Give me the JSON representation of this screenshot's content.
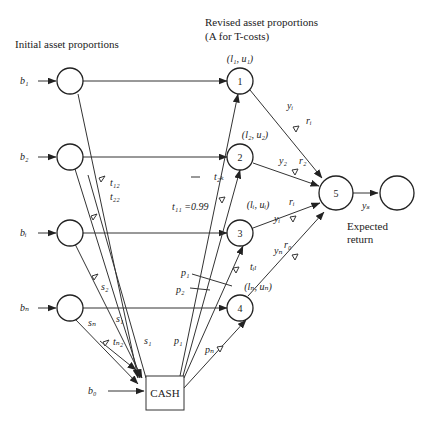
{
  "diagram": {
    "headings": {
      "initial": "Initial asset proportions",
      "revised_line1": "Revised asset proportions",
      "revised_line2": "(A for T-costs)",
      "expected_line1": "Expected",
      "expected_line2": "return"
    },
    "inputs": {
      "b1": "b₁",
      "b2": "b₂",
      "bi": "bᵢ",
      "bn": "bₙ",
      "b0": "b₀"
    },
    "cash_label": "CASH",
    "nodes": {
      "n1": "1",
      "n2": "2",
      "n3": "3",
      "n4": "4",
      "n5": "5"
    },
    "bounds": {
      "n1": "(l₁, u₁)",
      "n2": "(l₂, u₂)",
      "n3": "(lᵢ, uᵢ)",
      "n4": "(lₙ, uₙ)"
    },
    "edge_labels": {
      "t12": "t₁₂",
      "t22": "t₂₂",
      "t2k": "t₂ₖ",
      "t11": "t₁₁ =0.99",
      "til": "tᵢₗ",
      "tn2": "tₙ₂",
      "s1a": "s₁",
      "s1b": "s₁",
      "s2": "s₂",
      "sn": "sₙ",
      "p1a": "p₁",
      "p2": "p₂",
      "p1b": "p₁",
      "pn": "pₙ",
      "y1": "yᵢ",
      "r1": "rᵢ",
      "y2": "y₂",
      "r2": "r₂",
      "yi": "yᵢ",
      "ri": "rᵢ",
      "yn": "yₙ",
      "r0": "r₀",
      "ys": "yₛ"
    }
  }
}
